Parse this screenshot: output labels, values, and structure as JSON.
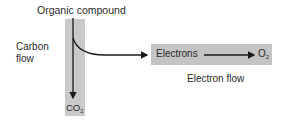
{
  "diagram": {
    "top_label": "Organic compound",
    "carbon_flow_label": [
      "Carbon",
      "flow"
    ],
    "co2_label": {
      "base": "CO",
      "sub": "2"
    },
    "electrons_label": "Electrons",
    "o2_label": {
      "base": "O",
      "sub": "2"
    },
    "electron_flow_label": "Electron flow",
    "colors": {
      "carbon_band": "#c9c9c9",
      "electron_band": "#c4c4c4",
      "arrow": "#1a1a1a",
      "text": "#2a2a2a"
    }
  }
}
